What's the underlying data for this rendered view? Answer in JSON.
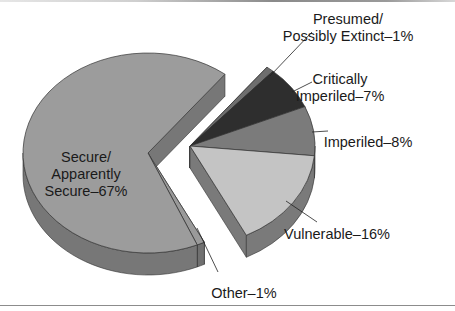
{
  "chart_data": {
    "type": "pie",
    "style": "3d-exploded",
    "title": "",
    "slices": [
      {
        "label": "Presumed/ Possibly Extinct",
        "value": 1,
        "label_text": [
          "Presumed/",
          "Possibly Extinct–1%"
        ],
        "color": "#6e6e6e",
        "side": "#555555",
        "exploded": false
      },
      {
        "label": "Critically Imperiled",
        "value": 7,
        "label_text": [
          "Critically",
          "Imperiled–7%"
        ],
        "color": "#2e2e2e",
        "side": "#242424",
        "exploded": false
      },
      {
        "label": "Imperiled",
        "value": 8,
        "label_text": [
          "Imperiled–8%"
        ],
        "color": "#7b7b7b",
        "side": "#5c5c5c",
        "exploded": false
      },
      {
        "label": "Vulnerable",
        "value": 16,
        "label_text": [
          "Vulnerable–16%"
        ],
        "color": "#c4c4c4",
        "side": "#7a7a7a",
        "exploded": false
      },
      {
        "label": "Other",
        "value": 1,
        "label_text": [
          "Other–1%"
        ],
        "color": "#9a9a9a",
        "side": "#707070",
        "exploded": true
      },
      {
        "label": "Secure/ Apparently Secure",
        "value": 67,
        "label_text": [
          "Secure/",
          "Apparently",
          "Secure–67%"
        ],
        "color": "#9c9c9c",
        "side": "#777777",
        "exploded": true
      }
    ],
    "legend": "none",
    "units": "%"
  }
}
